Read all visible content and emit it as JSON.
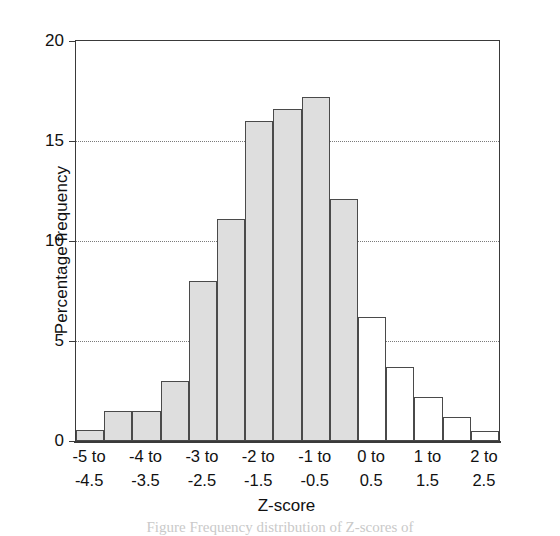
{
  "chart_data": {
    "type": "bar",
    "title": "",
    "xlabel": "Z-score",
    "ylabel": "Percentage frequency",
    "ylim": [
      0,
      20
    ],
    "yticks": [
      0,
      5,
      10,
      15,
      20
    ],
    "ytick_labels": [
      "0",
      "5",
      "10",
      "15",
      "20"
    ],
    "grid": "horizontal dotted at 5, 10, 15",
    "legend": "none",
    "bar_edge_color": "#4a4a4a",
    "shaded_fill": "#dedede",
    "open_fill": "#ffffff",
    "categories": [
      "-5 to -4.5",
      "-4.5 to -4",
      "-4 to -3.5",
      "-3.5 to -3",
      "-3 to -2.5",
      "-2.5 to -2",
      "-2 to -1.5",
      "-1.5 to -1",
      "-1 to -0.5",
      "-0.5 to 0",
      "0 to 0.5",
      "0.5 to 1",
      "1 to 1.5",
      "1.5 to 2",
      "2 to 2.5"
    ],
    "values": [
      0.55,
      1.5,
      1.5,
      3.0,
      8.0,
      11.1,
      16.0,
      16.6,
      17.2,
      12.1,
      6.2,
      3.7,
      2.2,
      1.2,
      0.5
    ],
    "bar_styles": [
      "shaded",
      "shaded",
      "shaded",
      "shaded",
      "shaded",
      "shaded",
      "shaded",
      "shaded",
      "shaded",
      "shaded",
      "open",
      "open",
      "open",
      "open",
      "open"
    ],
    "xtick_labels": [
      {
        "line1": "-5 to",
        "line2": "-4.5",
        "bar_index": 0
      },
      {
        "line1": "-4 to",
        "line2": "-3.5",
        "bar_index": 2
      },
      {
        "line1": "-3 to",
        "line2": "-2.5",
        "bar_index": 4
      },
      {
        "line1": "-2 to",
        "line2": "-1.5",
        "bar_index": 6
      },
      {
        "line1": "-1 to",
        "line2": "-0.5",
        "bar_index": 8
      },
      {
        "line1": "0 to",
        "line2": "0.5",
        "bar_index": 10
      },
      {
        "line1": "1 to",
        "line2": "1.5",
        "bar_index": 12
      },
      {
        "line1": "2 to",
        "line2": "2.5",
        "bar_index": 14
      }
    ]
  },
  "caption_remnant": "Figure   Frequency distribution of Z-scores of"
}
